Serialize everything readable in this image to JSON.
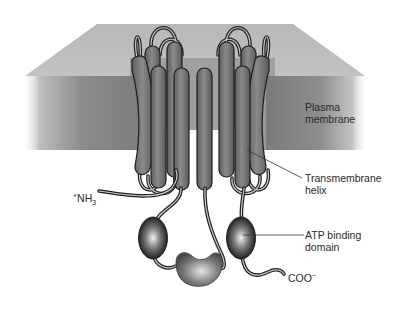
{
  "diagram": {
    "labels": {
      "plasma_membrane": {
        "line1": "Plasma",
        "line2": "membrane"
      },
      "transmembrane_helix": {
        "line1": "Transmembrane",
        "line2": "helix"
      },
      "atp_binding_domain": {
        "line1": "ATP binding",
        "line2": "domain"
      },
      "n_terminus": {
        "prefix": "+",
        "text": "NH",
        "subscript": "3"
      },
      "c_terminus": {
        "text": "COO",
        "superscript": "−"
      }
    },
    "components": {
      "membrane": {
        "top_color": "#bdbdbd",
        "front_color": "#8a8a8a",
        "recess_color": "#a3a3a3"
      },
      "helix_count": 8,
      "helix_color": "#7a7a7a",
      "atp_domains": 2,
      "linker_domain": 1
    }
  }
}
